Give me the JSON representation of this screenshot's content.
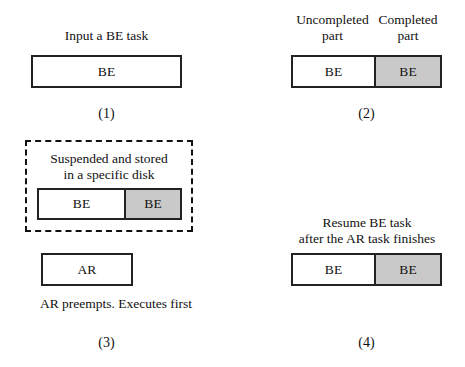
{
  "figure": {
    "title_present": false,
    "background_color": "#ffffff",
    "shaded_color": "#c9c9c9",
    "line_color": "#222222"
  },
  "panels": [
    {
      "id": "panel-1",
      "number": "(1)",
      "caption": "Input a BE task",
      "bar": {
        "segments": [
          {
            "label": "BE",
            "shading": "white"
          }
        ]
      }
    },
    {
      "id": "panel-2",
      "number": "(2)",
      "label_left": "Uncompleted\npart",
      "label_right": "Completed\npart",
      "bar": {
        "segments": [
          {
            "label": "BE",
            "shading": "white"
          },
          {
            "label": "BE",
            "shading": "gray"
          }
        ]
      }
    },
    {
      "id": "panel-3",
      "number": "(3)",
      "dashed_caption": "Suspended and stored\nin a specific disk",
      "bar": {
        "segments": [
          {
            "label": "BE",
            "shading": "white"
          },
          {
            "label": "BE",
            "shading": "gray"
          }
        ]
      },
      "ar_bar": {
        "segments": [
          {
            "label": "AR",
            "shading": "white"
          }
        ]
      },
      "footer_caption": "AR preempts. Executes first"
    },
    {
      "id": "panel-4",
      "number": "(4)",
      "caption": "Resume BE task\nafter the AR task finishes",
      "bar": {
        "segments": [
          {
            "label": "BE",
            "shading": "white"
          },
          {
            "label": "BE",
            "shading": "gray"
          }
        ]
      }
    }
  ]
}
